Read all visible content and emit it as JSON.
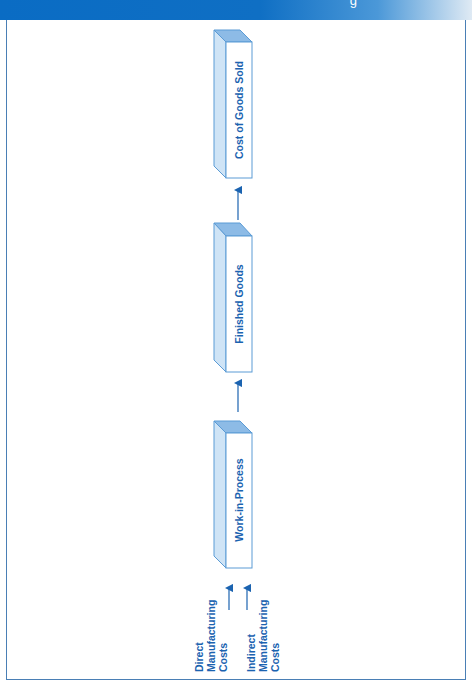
{
  "header": {
    "text": "g",
    "color": "#0a6cc4"
  },
  "diagram": {
    "title": "",
    "stages": [
      {
        "label": "Cost of Goods Sold"
      },
      {
        "label": "Finished Goods"
      },
      {
        "label": "Work-in-Process"
      }
    ],
    "inputs": [
      {
        "line1": "Direct",
        "line2": "Manufacturing",
        "line3": "Costs"
      },
      {
        "line1": "Indirect",
        "line2": "Manufacturing",
        "line3": "Costs"
      }
    ],
    "colors": {
      "accent": "#1b63b0",
      "box_top": "#7fb2e0",
      "box_side": "#c6dff3",
      "box_border": "#5b9bd5",
      "arrow": "#1b63b0",
      "frame": "#4a7fb5"
    }
  }
}
